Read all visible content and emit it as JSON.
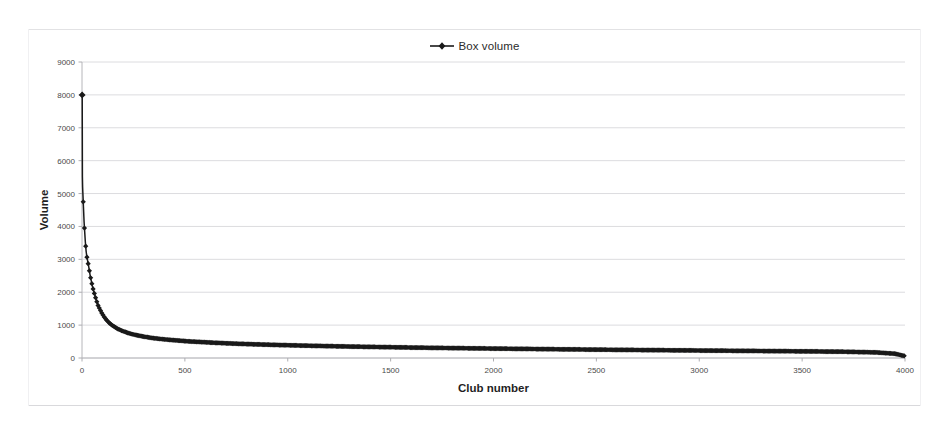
{
  "chart_data": {
    "type": "line",
    "title": "",
    "xlabel": "Club number",
    "ylabel": "Volume",
    "xlim": [
      0,
      4000
    ],
    "ylim": [
      0,
      9000
    ],
    "grid": "horizontal",
    "legend_position": "top-center",
    "xticks": [
      0,
      500,
      1000,
      1500,
      2000,
      2500,
      3000,
      3500,
      4000
    ],
    "xtick_labels": [
      "0",
      "500",
      "1000",
      "1500",
      "2000",
      "2500",
      "3000",
      "3500",
      "4000"
    ],
    "yticks": [
      0,
      1000,
      2000,
      3000,
      4000,
      5000,
      6000,
      7000,
      8000,
      9000
    ],
    "ytick_labels": [
      "0",
      "1000",
      "2000",
      "3000",
      "4000",
      "5000",
      "6000",
      "7000",
      "8000",
      "9000"
    ],
    "series": [
      {
        "name": "Box volume",
        "color": "#1a1a1a",
        "marker": "diamond",
        "x": [
          1,
          2,
          3,
          4,
          5,
          6,
          7,
          8,
          9,
          10,
          12,
          14,
          16,
          18,
          20,
          23,
          26,
          29,
          32,
          36,
          40,
          45,
          50,
          56,
          63,
          70,
          78,
          87,
          97,
          108,
          120,
          135,
          150,
          170,
          190,
          215,
          240,
          270,
          300,
          340,
          380,
          420,
          470,
          520,
          580,
          640,
          710,
          780,
          860,
          950,
          1040,
          1140,
          1250,
          1360,
          1480,
          1600,
          1730,
          1870,
          2010,
          2160,
          2310,
          2470,
          2630,
          2800,
          2970,
          3150,
          3330,
          3520,
          3710,
          3860,
          3950,
          4000
        ],
        "values": [
          8000,
          5500,
          5200,
          5050,
          4900,
          4750,
          4600,
          4450,
          4300,
          4150,
          3950,
          3750,
          3550,
          3400,
          3250,
          3100,
          3000,
          2900,
          2800,
          2650,
          2500,
          2350,
          2200,
          2050,
          1900,
          1750,
          1600,
          1480,
          1360,
          1250,
          1150,
          1050,
          980,
          900,
          840,
          780,
          730,
          690,
          650,
          610,
          580,
          555,
          530,
          505,
          485,
          465,
          445,
          428,
          412,
          396,
          382,
          368,
          354,
          342,
          330,
          318,
          307,
          296,
          286,
          276,
          266,
          256,
          247,
          238,
          229,
          220,
          211,
          202,
          190,
          170,
          130,
          60
        ]
      }
    ]
  },
  "legend": {
    "entries": [
      {
        "label": "Box volume"
      }
    ]
  },
  "axes": {
    "x_title": "Club number",
    "y_title": "Volume"
  }
}
